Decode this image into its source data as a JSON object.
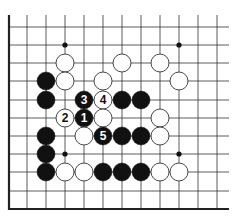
{
  "diagram": {
    "type": "go-board-fragment",
    "colors": {
      "black": "#111111",
      "white": "#ffffff",
      "line": "#333333",
      "edge": "#222222"
    },
    "grid": {
      "x": [
        9,
        27,
        46,
        65,
        84,
        103,
        122,
        141,
        160,
        179,
        198,
        217
      ],
      "y": [
        27,
        45,
        63,
        81,
        100,
        118,
        136,
        154,
        172,
        191,
        209
      ],
      "line_x_extent": [
        9,
        229
      ],
      "line_y_extent": [
        15,
        209
      ],
      "left_edge": true,
      "bottom_edge": true
    },
    "star_points": [
      {
        "c": 3,
        "r": 1
      },
      {
        "c": 9,
        "r": 1
      },
      {
        "c": 3,
        "r": 7
      },
      {
        "c": 9,
        "r": 7
      }
    ],
    "stones": [
      {
        "color": "white",
        "c": 3,
        "r": 2
      },
      {
        "color": "white",
        "c": 6,
        "r": 2
      },
      {
        "color": "white",
        "c": 8,
        "r": 2
      },
      {
        "color": "black",
        "c": 2,
        "r": 3
      },
      {
        "color": "white",
        "c": 3,
        "r": 3
      },
      {
        "color": "white",
        "c": 5,
        "r": 3
      },
      {
        "color": "white",
        "c": 9,
        "r": 3
      },
      {
        "color": "black",
        "c": 2,
        "r": 4
      },
      {
        "color": "black",
        "c": 4,
        "r": 4,
        "label": "3"
      },
      {
        "color": "white",
        "c": 5,
        "r": 4,
        "label": "4"
      },
      {
        "color": "black",
        "c": 6,
        "r": 4
      },
      {
        "color": "black",
        "c": 7,
        "r": 4
      },
      {
        "color": "white",
        "c": 3,
        "r": 5,
        "label": "2"
      },
      {
        "color": "black",
        "c": 4,
        "r": 5,
        "label": "1"
      },
      {
        "color": "white",
        "c": 5,
        "r": 5
      },
      {
        "color": "white",
        "c": 8,
        "r": 5
      },
      {
        "color": "black",
        "c": 2,
        "r": 6
      },
      {
        "color": "white",
        "c": 4,
        "r": 6
      },
      {
        "color": "black",
        "c": 5,
        "r": 6,
        "label": "5"
      },
      {
        "color": "black",
        "c": 6,
        "r": 6
      },
      {
        "color": "black",
        "c": 7,
        "r": 6
      },
      {
        "color": "white",
        "c": 8,
        "r": 6
      },
      {
        "color": "black",
        "c": 2,
        "r": 7
      },
      {
        "color": "black",
        "c": 2,
        "r": 8
      },
      {
        "color": "white",
        "c": 3,
        "r": 8
      },
      {
        "color": "white",
        "c": 4,
        "r": 8
      },
      {
        "color": "black",
        "c": 5,
        "r": 8
      },
      {
        "color": "black",
        "c": 6,
        "r": 8
      },
      {
        "color": "black",
        "c": 7,
        "r": 8
      },
      {
        "color": "white",
        "c": 8,
        "r": 8
      },
      {
        "color": "white",
        "c": 9,
        "r": 8
      }
    ]
  }
}
